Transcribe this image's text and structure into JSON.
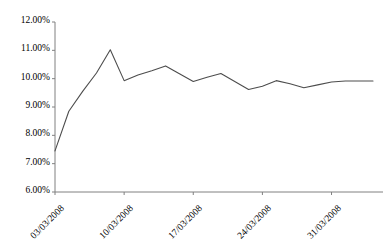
{
  "chart_data": {
    "type": "line",
    "title": "",
    "xlabel": "",
    "ylabel": "",
    "ylim": [
      6.0,
      12.0
    ],
    "ytick_values": [
      6.0,
      7.0,
      8.0,
      9.0,
      10.0,
      11.0,
      12.0
    ],
    "ytick_labels": [
      "6.00%",
      "7.00%",
      "8.00%",
      "9.00%",
      "10.00%",
      "11.00%",
      "12.00%"
    ],
    "xtick_labels": [
      "03/03/2008",
      "10/03/2008",
      "17/03/2008",
      "24/03/2008",
      "31/03/2008"
    ],
    "xtick_indices": [
      0,
      5,
      10,
      15,
      20
    ],
    "grid": false,
    "legend": false,
    "line_color": "#4d4d4d",
    "axis_color": "#808080",
    "x": [
      "03/03/2008",
      "04/03/2008",
      "05/03/2008",
      "06/03/2008",
      "07/03/2008",
      "10/03/2008",
      "11/03/2008",
      "12/03/2008",
      "13/03/2008",
      "14/03/2008",
      "17/03/2008",
      "18/03/2008",
      "19/03/2008",
      "20/03/2008",
      "21/03/2008",
      "24/03/2008",
      "25/03/2008",
      "26/03/2008",
      "27/03/2008",
      "28/03/2008",
      "31/03/2008",
      "01/04/2008",
      "02/04/2008",
      "03/04/2008"
    ],
    "values": [
      7.45,
      8.85,
      9.55,
      10.2,
      11.02,
      9.93,
      10.13,
      10.28,
      10.45,
      10.17,
      9.9,
      10.05,
      10.18,
      9.9,
      9.62,
      9.73,
      9.93,
      9.82,
      9.68,
      9.78,
      9.88,
      9.92,
      9.92,
      9.92
    ],
    "series": [
      {
        "name": "rate",
        "values": [
          7.45,
          8.85,
          9.55,
          10.2,
          11.02,
          9.93,
          10.13,
          10.28,
          10.45,
          10.17,
          9.9,
          10.05,
          10.18,
          9.9,
          9.62,
          9.73,
          9.93,
          9.82,
          9.68,
          9.78,
          9.88,
          9.92,
          9.92,
          9.92
        ]
      }
    ]
  }
}
